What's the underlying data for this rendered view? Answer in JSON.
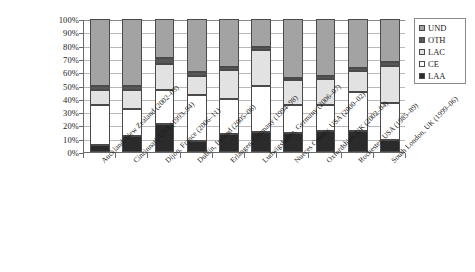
{
  "chart_data": {
    "type": "bar",
    "subtype": "stacked-percentage-column",
    "title": "",
    "subtitle": "",
    "xlabel": "",
    "ylabel": "",
    "ylim": [
      0,
      100
    ],
    "y_tick_labels": [
      "100%",
      "90%",
      "80%",
      "70%",
      "60%",
      "50%",
      "40%",
      "30%",
      "20%",
      "10%",
      "0%"
    ],
    "y_tick_values": [
      100,
      90,
      80,
      70,
      60,
      50,
      40,
      30,
      20,
      10,
      0
    ],
    "grid": true,
    "grid_axis": "y",
    "legend_position": "right",
    "stack_order_bottom_to_top": [
      "LAA",
      "CE",
      "LAC",
      "OTH",
      "UND"
    ],
    "categories": [
      "Auckland, New Zealand (2002–03)",
      "Cincinnati, USA (1993–94)",
      "Dijon, France (2006–11)",
      "Dublin, Ireland (2005–06)",
      "Erlangen, Germany (1994–98)",
      "Ludwigshafen, Germany (2006–07)",
      "Nueces County, USA (2000–02)",
      "Oxfordshire, UK (2002–04)",
      "Rochester, USA (1985–89)",
      "South London, UK (1999–06)"
    ],
    "series": [
      {
        "name": "LAA",
        "color": "#2b2b2b",
        "values": [
          5.5,
          12.0,
          21.0,
          8.5,
          13.5,
          15.0,
          14.0,
          16.0,
          16.0,
          9.0
        ]
      },
      {
        "name": "CE",
        "color": "#ffffff",
        "values": [
          29.5,
          20.0,
          26.0,
          34.5,
          26.5,
          35.0,
          21.0,
          19.0,
          29.0,
          27.5
        ]
      },
      {
        "name": "LAC",
        "color": "#e2e2e2",
        "values": [
          12.0,
          15.0,
          19.0,
          14.0,
          22.0,
          27.0,
          19.0,
          20.0,
          16.0,
          28.5
        ]
      },
      {
        "name": "OTH",
        "color": "#585858",
        "values": [
          3.0,
          3.0,
          5.0,
          3.0,
          2.0,
          2.0,
          2.0,
          2.0,
          2.5,
          2.5
        ]
      },
      {
        "name": "UND",
        "color": "#a3a3a3",
        "values": [
          50.0,
          50.0,
          29.0,
          40.0,
          36.0,
          21.0,
          44.0,
          43.0,
          36.5,
          32.5
        ]
      }
    ],
    "cumulative_tops": [
      [
        5.5,
        35.0,
        47.0,
        50.0,
        100.0
      ],
      [
        12.0,
        32.0,
        47.0,
        50.0,
        100.0
      ],
      [
        21.0,
        47.0,
        66.0,
        71.0,
        100.0
      ],
      [
        8.5,
        43.0,
        57.0,
        60.0,
        100.0
      ],
      [
        13.5,
        40.0,
        62.0,
        64.0,
        100.0
      ],
      [
        15.0,
        50.0,
        77.0,
        79.0,
        100.0
      ],
      [
        14.0,
        35.0,
        54.0,
        56.0,
        100.0
      ],
      [
        16.0,
        35.0,
        55.0,
        57.0,
        100.0
      ],
      [
        16.0,
        45.0,
        61.0,
        63.5,
        100.0
      ],
      [
        9.0,
        36.5,
        65.0,
        67.5,
        100.0
      ]
    ]
  },
  "legend": {
    "items": [
      {
        "label": "UND",
        "color": "#a3a3a3"
      },
      {
        "label": "OTH",
        "color": "#585858"
      },
      {
        "label": "LAC",
        "color": "#e2e2e2"
      },
      {
        "label": "CE",
        "color": "#ffffff"
      },
      {
        "label": "LAA",
        "color": "#2b2b2b"
      }
    ]
  },
  "colors": {
    "axis": "#6b6b6b",
    "gridline": "#b9b9b9",
    "segment_border": "#4a4a4a",
    "text": "#1a1a1a",
    "background": "#ffffff"
  }
}
